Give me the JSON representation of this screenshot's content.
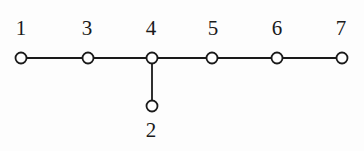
{
  "figure": {
    "background_color": "#fdfdfd",
    "stroke_color": "#1a1a1a",
    "label_color": "#1a1a1a",
    "node_fill": "#ffffff",
    "node_radius": 5.5,
    "edge_width": 1.8
  },
  "chart_data": {
    "type": "diagram",
    "title": "",
    "xlabel": "",
    "ylabel": "",
    "nodes": [
      {
        "id": "n1",
        "label": "1",
        "x": 21,
        "y": 58,
        "label_x": 21,
        "label_y": 18,
        "label_position": "above"
      },
      {
        "id": "n3",
        "label": "3",
        "x": 88,
        "y": 58,
        "label_x": 87,
        "label_y": 18,
        "label_position": "above"
      },
      {
        "id": "n4",
        "label": "4",
        "x": 152,
        "y": 58,
        "label_x": 151,
        "label_y": 18,
        "label_position": "above"
      },
      {
        "id": "n5",
        "label": "5",
        "x": 212,
        "y": 58,
        "label_x": 213,
        "label_y": 18,
        "label_position": "above"
      },
      {
        "id": "n6",
        "label": "6",
        "x": 277,
        "y": 58,
        "label_x": 277,
        "label_y": 18,
        "label_position": "above"
      },
      {
        "id": "n7",
        "label": "7",
        "x": 342,
        "y": 58,
        "label_x": 341,
        "label_y": 18,
        "label_position": "above"
      },
      {
        "id": "n2",
        "label": "2",
        "x": 152,
        "y": 106,
        "label_x": 151,
        "label_y": 120,
        "label_position": "below"
      }
    ],
    "edges": [
      {
        "from": "n1",
        "to": "n3",
        "x1": 27,
        "y1": 58,
        "x2": 82,
        "y2": 58
      },
      {
        "from": "n3",
        "to": "n4",
        "x1": 94,
        "y1": 58,
        "x2": 146,
        "y2": 58
      },
      {
        "from": "n4",
        "to": "n5",
        "x1": 158,
        "y1": 58,
        "x2": 206,
        "y2": 58
      },
      {
        "from": "n5",
        "to": "n6",
        "x1": 218,
        "y1": 58,
        "x2": 271,
        "y2": 58
      },
      {
        "from": "n6",
        "to": "n7",
        "x1": 283,
        "y1": 58,
        "x2": 336,
        "y2": 58
      },
      {
        "from": "n4",
        "to": "n2",
        "x1": 152,
        "y1": 64,
        "x2": 152,
        "y2": 100
      }
    ]
  }
}
